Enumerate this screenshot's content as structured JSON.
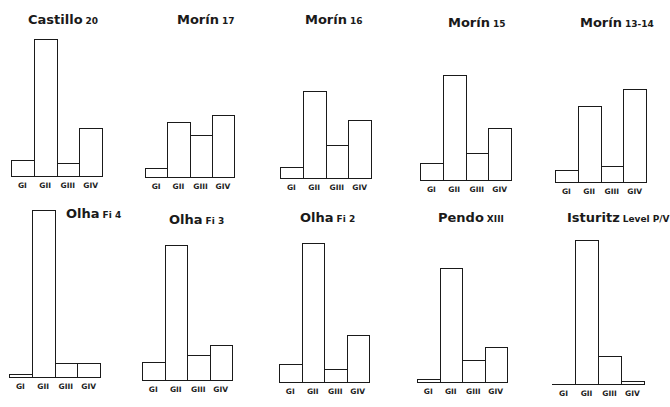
{
  "chart_data": [
    {
      "type": "bar",
      "title": "Castillo",
      "subtitle": "20",
      "categories": [
        "GI",
        "GII",
        "GIII",
        "GIV"
      ],
      "values": [
        16,
        137,
        13,
        48
      ],
      "ylabel": "",
      "xlabel": ""
    },
    {
      "type": "bar",
      "title": "Morín",
      "subtitle": "17",
      "categories": [
        "GI",
        "GII",
        "GIII",
        "GIV"
      ],
      "values": [
        9,
        55,
        42,
        62
      ]
    },
    {
      "type": "bar",
      "title": "Morín",
      "subtitle": "16",
      "categories": [
        "GI",
        "GII",
        "GIII",
        "GIV"
      ],
      "values": [
        11,
        87,
        33,
        58
      ]
    },
    {
      "type": "bar",
      "title": "Morín",
      "subtitle": "15",
      "categories": [
        "GI",
        "GII",
        "GIII",
        "GIV"
      ],
      "values": [
        17,
        105,
        27,
        52
      ]
    },
    {
      "type": "bar",
      "title": "Morín",
      "subtitle": "13-14",
      "categories": [
        "GI",
        "GII",
        "GIII",
        "GIV"
      ],
      "values": [
        12,
        76,
        16,
        93
      ]
    },
    {
      "type": "bar",
      "title": "Olha",
      "subtitle": "Fi 4",
      "categories": [
        "GI",
        "GII",
        "GIII",
        "GIV"
      ],
      "values": [
        3,
        167,
        14,
        14
      ]
    },
    {
      "type": "bar",
      "title": "Olha",
      "subtitle": "Fi 3",
      "categories": [
        "GI",
        "GII",
        "GIII",
        "GIV"
      ],
      "values": [
        18,
        135,
        25,
        35
      ]
    },
    {
      "type": "bar",
      "title": "Olha",
      "subtitle": "Fi 2",
      "categories": [
        "GI",
        "GII",
        "GIII",
        "GIV"
      ],
      "values": [
        18,
        139,
        13,
        47
      ]
    },
    {
      "type": "bar",
      "title": "Pendo",
      "subtitle": "XIII",
      "categories": [
        "GI",
        "GII",
        "GIII",
        "GIV"
      ],
      "values": [
        3,
        114,
        22,
        35
      ]
    },
    {
      "type": "bar",
      "title": "Isturitz",
      "subtitle": "Level P/V",
      "categories": [
        "GI",
        "GII",
        "GIII",
        "GIV"
      ],
      "values": [
        0,
        144,
        28,
        3
      ]
    }
  ],
  "layout": [
    {
      "x": 11,
      "w": 91,
      "base": 176,
      "tx": 28,
      "ty": 12
    },
    {
      "x": 145,
      "w": 89,
      "base": 177,
      "tx": 177,
      "ty": 12
    },
    {
      "x": 280,
      "w": 91,
      "base": 178,
      "tx": 305,
      "ty": 12
    },
    {
      "x": 420,
      "w": 91,
      "base": 180,
      "tx": 448,
      "ty": 15
    },
    {
      "x": 555,
      "w": 91,
      "base": 182,
      "tx": 580,
      "ty": 15
    },
    {
      "x": 9,
      "w": 91,
      "base": 377,
      "tx": 66,
      "ty": 206
    },
    {
      "x": 142,
      "w": 90,
      "base": 380,
      "tx": 169,
      "ty": 212
    },
    {
      "x": 279,
      "w": 90,
      "base": 382,
      "tx": 300,
      "ty": 210
    },
    {
      "x": 417,
      "w": 90,
      "base": 382,
      "tx": 438,
      "ty": 210
    },
    {
      "x": 552,
      "w": 92,
      "base": 384,
      "tx": 567,
      "ty": 210
    }
  ]
}
